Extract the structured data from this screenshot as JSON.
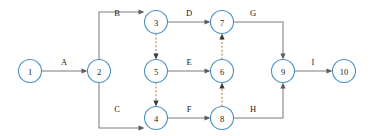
{
  "diagram": {
    "type": "directed-graph",
    "canvas": {
      "width": 373,
      "height": 136
    },
    "colors": {
      "node_stroke": "#4a90c4",
      "node_fill": "#ffffff",
      "edge_solid": "#7d7d7d",
      "edge_dashed": "#c09a78",
      "arrowhead_solid": "#5d5d5d",
      "arrowhead_dashed": "#3a3a3a",
      "text": "#1a1a1a",
      "background": "#ffffff"
    },
    "node_radius": 11.5,
    "nodes": [
      {
        "id": "n1",
        "label": "1",
        "x": 30,
        "y": 71
      },
      {
        "id": "n2",
        "label": "2",
        "x": 99,
        "y": 71
      },
      {
        "id": "n3",
        "label": "3",
        "x": 156,
        "y": 22
      },
      {
        "id": "n4",
        "label": "4",
        "x": 156,
        "y": 118
      },
      {
        "id": "n5",
        "label": "5",
        "x": 156,
        "y": 71
      },
      {
        "id": "n6",
        "label": "6",
        "x": 222,
        "y": 71
      },
      {
        "id": "n7",
        "label": "7",
        "x": 222,
        "y": 22
      },
      {
        "id": "n8",
        "label": "8",
        "x": 222,
        "y": 118
      },
      {
        "id": "n9",
        "label": "9",
        "x": 283,
        "y": 71
      },
      {
        "id": "n10",
        "label": "10",
        "x": 344,
        "y": 71
      }
    ],
    "edges": [
      {
        "id": "e-a",
        "label": "A",
        "from": "n1",
        "to": "n2",
        "style": "solid",
        "label_x": 64,
        "label_y": 65
      },
      {
        "id": "e-b",
        "label": "B",
        "from": "n2",
        "to": "n3",
        "style": "solid",
        "label_x": 117,
        "label_y": 16
      },
      {
        "id": "e-c",
        "label": "C",
        "from": "n2",
        "to": "n4",
        "style": "solid",
        "label_x": 117,
        "label_y": 112
      },
      {
        "id": "e-d",
        "label": "D",
        "from": "n3",
        "to": "n7",
        "style": "solid",
        "label_x": 189,
        "label_y": 16
      },
      {
        "id": "e-e",
        "label": "E",
        "from": "n5",
        "to": "n6",
        "style": "solid",
        "label_x": 189,
        "label_y": 65
      },
      {
        "id": "e-f",
        "label": "F",
        "from": "n4",
        "to": "n8",
        "style": "solid",
        "label_x": 189,
        "label_y": 112
      },
      {
        "id": "e-g",
        "label": "G",
        "from": "n7",
        "to": "n9",
        "style": "solid",
        "label_x": 253,
        "label_y": 16
      },
      {
        "id": "e-h",
        "label": "H",
        "from": "n8",
        "to": "n9",
        "style": "solid",
        "label_x": 253,
        "label_y": 112
      },
      {
        "id": "e-i",
        "label": "I",
        "from": "n9",
        "to": "n10",
        "style": "solid",
        "label_x": 313,
        "label_y": 65
      },
      {
        "id": "e-dummy-3-5",
        "label": "",
        "from": "n3",
        "to": "n5",
        "style": "dashed"
      },
      {
        "id": "e-dummy-5-4",
        "label": "",
        "from": "n5",
        "to": "n4",
        "style": "dashed"
      },
      {
        "id": "e-dummy-8-6",
        "label": "",
        "from": "n8",
        "to": "n6",
        "style": "dashed"
      },
      {
        "id": "e-dummy-6-7",
        "label": "",
        "from": "n6",
        "to": "n7",
        "style": "dashed"
      }
    ]
  }
}
